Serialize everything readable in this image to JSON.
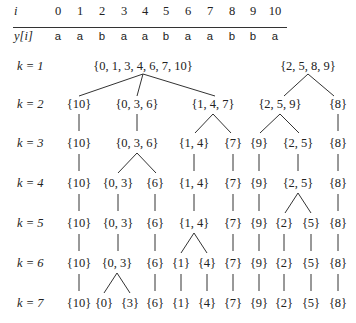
{
  "table": {
    "row_i_label": "i",
    "row_y_label": "y[i]",
    "indices": [
      "0",
      "1",
      "2",
      "3",
      "4",
      "5",
      "6",
      "7",
      "8",
      "9",
      "10"
    ],
    "values": [
      "a",
      "a",
      "b",
      "a",
      "a",
      "b",
      "a",
      "a",
      "b",
      "b",
      "a"
    ]
  },
  "levels": [
    {
      "label": "k = 1",
      "nodes": [
        "{0, 1, 3, 4, 6, 7, 10}",
        "{2, 5, 8, 9}"
      ]
    },
    {
      "label": "k = 2",
      "nodes": [
        "{10}",
        "{0, 3, 6}",
        "{1, 4, 7}",
        "{2, 5, 9}",
        "{8}"
      ]
    },
    {
      "label": "k = 3",
      "nodes": [
        "{10}",
        "{0, 3, 6}",
        "{1, 4}",
        "{7}",
        "{9}",
        "{2, 5}",
        "{8}"
      ]
    },
    {
      "label": "k = 4",
      "nodes": [
        "{10}",
        "{0, 3}",
        "{6}",
        "{1, 4}",
        "{7}",
        "{9}",
        "{2, 5}",
        "{8}"
      ]
    },
    {
      "label": "k = 5",
      "nodes": [
        "{10}",
        "{0, 3}",
        "{6}",
        "{1, 4}",
        "{7}",
        "{9}",
        "{2}",
        "{5}",
        "{8}"
      ]
    },
    {
      "label": "k = 6",
      "nodes": [
        "{10}",
        "{0, 3}",
        "{6}",
        "{1}",
        "{4}",
        "{7}",
        "{9}",
        "{2}",
        "{5}",
        "{8}"
      ]
    },
    {
      "label": "k = 7",
      "nodes": [
        "{10}",
        "{0}",
        "{3}",
        "{6}",
        "{1}",
        "{4}",
        "{7}",
        "{9}",
        "{2}",
        "{5}",
        "{8}"
      ]
    }
  ],
  "colors": {
    "text": "#222222",
    "lines": "#333333",
    "background": "#ffffff"
  }
}
